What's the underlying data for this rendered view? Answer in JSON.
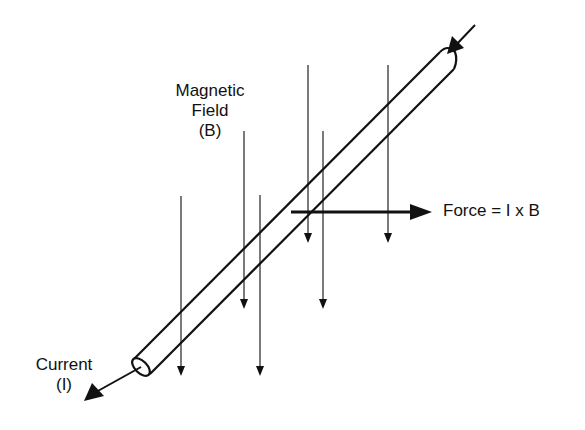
{
  "diagram": {
    "labels": {
      "field_line1": "Magnetic",
      "field_line2": "Field",
      "field_line3": "(B)",
      "force": "Force = I x B",
      "current_line1": "Current",
      "current_line2": "(I)"
    },
    "colors": {
      "ink": "#111111",
      "background": "#ffffff"
    }
  }
}
